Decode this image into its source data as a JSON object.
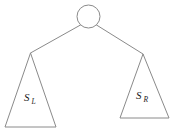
{
  "diagram": {
    "colors": {
      "stroke": "#8a8a8a",
      "background": "#ffffff",
      "text": "#1a1a1a"
    },
    "root": {
      "shape": "circle",
      "label": "",
      "cx": 88.5,
      "cy": 16.5,
      "r": 11.5
    },
    "edges": [
      {
        "name": "edge-root-to-left-subtree",
        "x1": 80.5,
        "y1": 25.0,
        "x2": 30.5,
        "y2": 53.0
      },
      {
        "name": "edge-root-to-right-subtree",
        "x1": 96.5,
        "y1": 25.0,
        "x2": 143.0,
        "y2": 54.0
      }
    ],
    "subtrees": [
      {
        "name": "left-subtree",
        "shape": "triangle",
        "label_main": "S",
        "label_sub": "L",
        "label_full": "S_L",
        "apex_x": 30.5,
        "apex_y": 53.0,
        "base_left_x": 5.0,
        "base_right_x": 56.0,
        "base_y": 127.0,
        "label_x": 24.0,
        "label_y": 101.0
      },
      {
        "name": "right-subtree",
        "shape": "triangle",
        "label_main": "S",
        "label_sub": "R",
        "label_full": "S_R",
        "apex_x": 143.0,
        "apex_y": 54.0,
        "base_left_x": 120.0,
        "base_right_x": 169.0,
        "base_y": 118.0,
        "label_x": 136.0,
        "label_y": 99.0
      }
    ]
  }
}
